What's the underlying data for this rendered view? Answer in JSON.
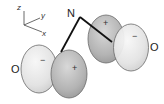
{
  "diagram": {
    "type": "molecular-orbital",
    "atoms": {
      "center": "N",
      "left": "O",
      "right": "O"
    },
    "axes": {
      "z": "z",
      "y": "y",
      "x": "x"
    },
    "lobes": {
      "left_outer_sign": "−",
      "left_inner_sign": "+",
      "right_inner_sign": "+",
      "right_outer_sign": "−"
    },
    "colors": {
      "light_lobe": "#e6e6e6",
      "dark_lobe": "#b5b5b5",
      "outline": "#6a6a6a",
      "bond": "#111111"
    }
  }
}
